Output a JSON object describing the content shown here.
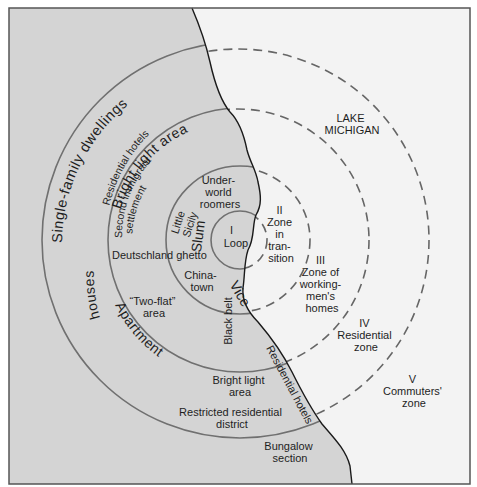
{
  "diagram": {
    "type": "concentric-zone-model",
    "colors": {
      "land": "#d4d4d4",
      "lake": "#f3f3f3",
      "frame": "#555555",
      "solid_ring": "#707070",
      "dashed_ring": "#666666",
      "coastline": "#1a1a1a",
      "text": "#1e1e1e"
    },
    "lake_label": {
      "line1": "LAKE",
      "line2": "MICHIGAN"
    },
    "zones": [
      {
        "numeral": "I",
        "name": "Loop"
      },
      {
        "numeral": "II",
        "line1": "Zone",
        "line2": "in",
        "line3": "tran-",
        "line4": "sition"
      },
      {
        "numeral": "III",
        "line1": "Zone of",
        "line2": "working-",
        "line3": "men's",
        "line4": "homes"
      },
      {
        "numeral": "IV",
        "line1": "Residential",
        "line2": "zone"
      },
      {
        "numeral": "V",
        "line1": "Commuters'",
        "line2": "zone"
      }
    ],
    "land_labels": {
      "single_family": "Single-family  dwellings",
      "residential_hotels_top": "Residential  hotels",
      "bright_light_top": "Bright light area",
      "second_immigrant_1": "Second immigrant",
      "second_immigrant_2": "settlement",
      "underworld_1": "Under-",
      "underworld_2": "world",
      "underworld_3": "roomers",
      "little_sicily_1": "Little",
      "little_sicily_2": "Sicily",
      "slum": "Slum",
      "deutschland": "Deutschland ghetto",
      "chinatown_1": "China-",
      "chinatown_2": "town",
      "vice": "Vice",
      "two_flat_1": "“Two-flat”",
      "two_flat_2": "area",
      "houses": "houses",
      "apartment": "Apartment",
      "black_belt": "Black belt",
      "bright_light_bottom_1": "Bright light",
      "bright_light_bottom_2": "area",
      "residential_hotels_coast": "Residential hotels",
      "restricted_1": "Restricted residential",
      "restricted_2": "district",
      "bungalow_1": "Bungalow",
      "bungalow_2": "section"
    }
  }
}
